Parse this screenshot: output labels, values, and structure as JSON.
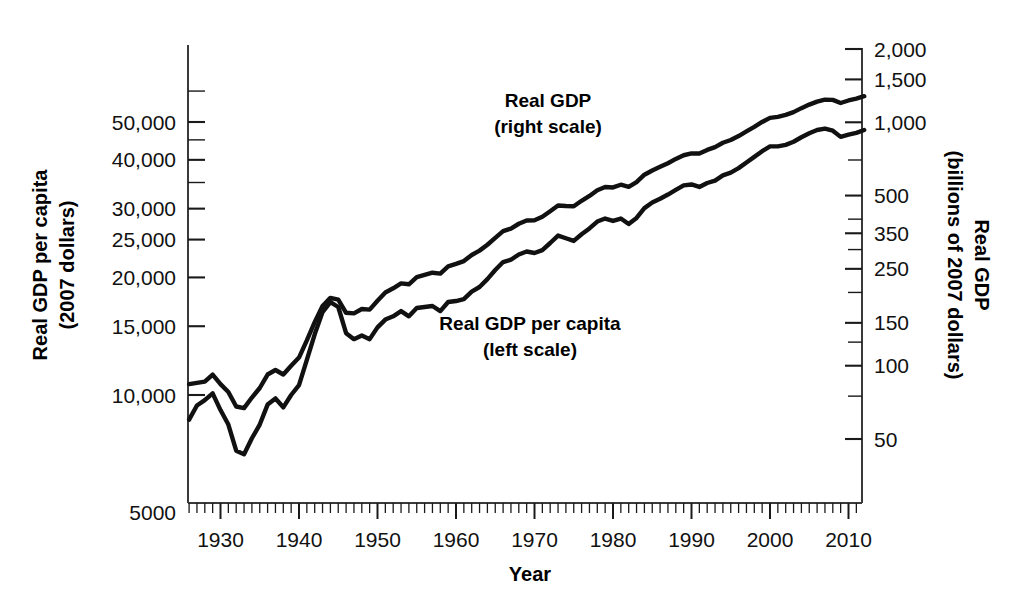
{
  "chart_data": {
    "type": "line",
    "title": "",
    "subtitle": "",
    "xlabel": "Year",
    "ylabel_left": "Real GDP per capita\n(2007 dollars)",
    "ylabel_right": "Real GDP\n(billions of 2007 dollars)",
    "left_axis": {
      "label_line1": "Real GDP per capita",
      "label_line2": "(2007 dollars)",
      "scale": "log",
      "unit": "2007 dollars",
      "ylim": [
        5000,
        62000
      ],
      "tick_labels": [
        "50,000",
        "40,000",
        "30,000",
        "25,000",
        "20,000",
        "15,000",
        "10,000",
        "5000"
      ],
      "tick_values": [
        50000,
        40000,
        30000,
        25000,
        20000,
        15000,
        10000,
        5000
      ],
      "minor_tick_values": [
        45000,
        35000,
        60000
      ]
    },
    "right_axis": {
      "label_line1": "Real GDP",
      "label_line2": "(billions of 2007 dollars)",
      "scale": "log",
      "unit": "billions of 2007 dollars",
      "ylim": [
        28,
        2300
      ],
      "tick_labels": [
        "2,000",
        "1,500",
        "1,000",
        "500",
        "350",
        "250",
        "150",
        "100",
        "50"
      ],
      "tick_values": [
        2000,
        1500,
        1000,
        500,
        350,
        250,
        150,
        100,
        50
      ],
      "minor_tick_values": [
        700,
        400,
        300,
        200,
        125,
        75
      ]
    },
    "x_axis": {
      "label": "Year",
      "xlim": [
        1926,
        2012
      ],
      "tick_labels": [
        "1930",
        "1940",
        "1950",
        "1960",
        "1970",
        "1980",
        "1990",
        "2000",
        "2010"
      ],
      "tick_values": [
        1930,
        1940,
        1950,
        1960,
        1970,
        1980,
        1990,
        2000,
        2010
      ],
      "minor_tick_interval": 1
    },
    "grid": false,
    "legend_position": "inline-annotations",
    "annotations": [
      {
        "name": "real-gdp-annotation",
        "line1": "Real GDP",
        "line2": "(right scale)",
        "x_px": 548,
        "y_px": 107
      },
      {
        "name": "real-gdp-per-capita-annotation",
        "line1": "Real GDP per capita",
        "line2": "(left scale)",
        "x_px": 530,
        "y_px": 330
      }
    ],
    "x": [
      1926,
      1927,
      1928,
      1929,
      1930,
      1931,
      1932,
      1933,
      1934,
      1935,
      1936,
      1937,
      1938,
      1939,
      1940,
      1941,
      1942,
      1943,
      1944,
      1945,
      1946,
      1947,
      1948,
      1949,
      1950,
      1951,
      1952,
      1953,
      1954,
      1955,
      1956,
      1957,
      1958,
      1959,
      1960,
      1961,
      1962,
      1963,
      1964,
      1965,
      1966,
      1967,
      1968,
      1969,
      1970,
      1971,
      1972,
      1973,
      1974,
      1975,
      1976,
      1977,
      1978,
      1979,
      1980,
      1981,
      1982,
      1983,
      1984,
      1985,
      1986,
      1987,
      1988,
      1989,
      1990,
      1991,
      1992,
      1993,
      1994,
      1995,
      1996,
      1997,
      1998,
      1999,
      2000,
      2001,
      2002,
      2003,
      2004,
      2005,
      2006,
      2007,
      2008,
      2009,
      2010,
      2011,
      2012
    ],
    "series": [
      {
        "name": "Real GDP",
        "axis": "right",
        "unit": "billions of 2007 dollars",
        "label": "Real GDP (right scale)",
        "color": "#111111",
        "values": [
          84,
          85,
          86,
          92,
          84,
          78,
          68,
          67,
          74,
          81,
          92,
          96,
          92,
          100,
          108,
          127,
          151,
          176,
          190,
          187,
          165,
          164,
          171,
          170,
          185,
          200,
          208,
          218,
          216,
          231,
          236,
          241,
          239,
          256,
          262,
          269,
          285,
          297,
          314,
          335,
          357,
          366,
          383,
          395,
          396,
          409,
          431,
          455,
          453,
          452,
          476,
          498,
          526,
          542,
          540,
          554,
          543,
          568,
          609,
          634,
          656,
          679,
          707,
          732,
          745,
          744,
          770,
          791,
          824,
          846,
          878,
          917,
          957,
          1003,
          1043,
          1053,
          1072,
          1101,
          1143,
          1182,
          1216,
          1238,
          1236,
          1200,
          1229,
          1251,
          1280
        ]
      },
      {
        "name": "Real GDP per capita",
        "axis": "left",
        "unit": "2007 dollars",
        "label": "Real GDP per capita (left scale)",
        "color": "#111111",
        "values": [
          8650,
          9400,
          9700,
          10100,
          9150,
          8400,
          7200,
          7050,
          7750,
          8400,
          9450,
          9800,
          9300,
          10000,
          10600,
          12300,
          14300,
          16300,
          17300,
          16800,
          14400,
          13900,
          14200,
          13900,
          14900,
          15600,
          15900,
          16400,
          15900,
          16700,
          16800,
          16900,
          16400,
          17300,
          17400,
          17600,
          18400,
          18900,
          19800,
          20900,
          21900,
          22200,
          22900,
          23300,
          23100,
          23500,
          24500,
          25600,
          25200,
          24800,
          25800,
          26700,
          27800,
          28300,
          27900,
          28300,
          27400,
          28400,
          30100,
          31100,
          31800,
          32600,
          33500,
          34400,
          34600,
          34100,
          34900,
          35400,
          36500,
          37100,
          38100,
          39400,
          40700,
          42100,
          43300,
          43300,
          43700,
          44500,
          45700,
          46800,
          47700,
          48100,
          47500,
          45800,
          46400,
          46900,
          47700
        ]
      }
    ]
  },
  "axis_titles": {
    "left_line1": "Real GDP per capita",
    "left_line2": "(2007 dollars)",
    "right_line1": "Real GDP",
    "right_line2": "(billions of 2007 dollars)",
    "x": "Year"
  }
}
